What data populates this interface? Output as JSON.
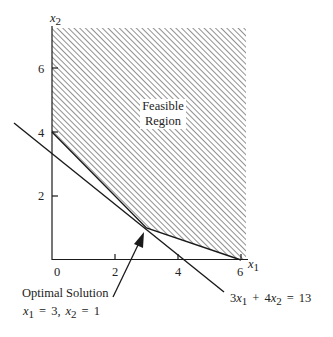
{
  "diagram": {
    "type": "linear-programming-feasible-region",
    "axes": {
      "x_label": "x",
      "x_label_sub": "1",
      "y_label": "x",
      "y_label_sub": "2",
      "x_ticks": [
        "0",
        "2",
        "4",
        "6"
      ],
      "y_ticks": [
        "2",
        "4",
        "6"
      ]
    },
    "region_label_line1": "Feasible",
    "region_label_line2": "Region",
    "objective_line_label": {
      "coef1": "3",
      "var1": "x",
      "sub1": "1",
      "plus": "+",
      "coef2": "4",
      "var2": "x",
      "sub2": "2",
      "eq": "=",
      "rhs": "13"
    },
    "optimal": {
      "title": "Optimal Solution",
      "var1": "x",
      "sub1": "1",
      "eq1": "=",
      "val1": "3,",
      "var2": "x",
      "sub2": "2",
      "eq2": "=",
      "val2": "1"
    },
    "colors": {
      "line": "#1a1a1a",
      "hatch": "#555555",
      "text": "#222222"
    }
  }
}
